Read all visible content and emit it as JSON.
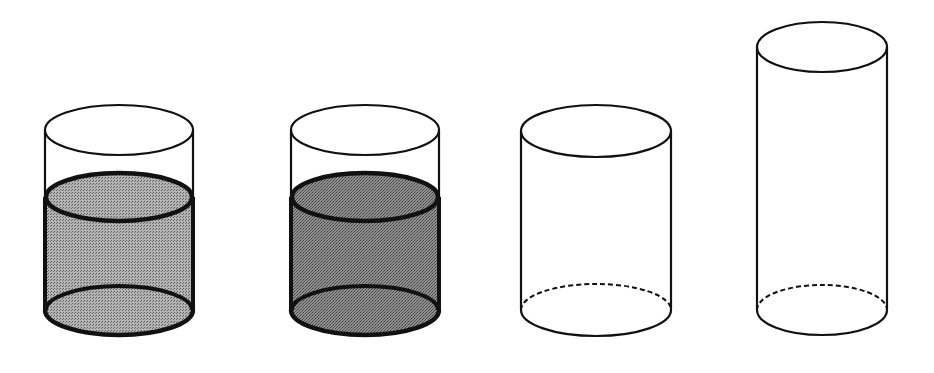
{
  "diagram": {
    "title": "",
    "colors": {
      "background": "#ffffff",
      "outline": "#1a1a1a",
      "liquid_light": "#9a9a9a",
      "liquid_light_surface": "#a8a8a8",
      "liquid_dark": "#7c7c7c",
      "liquid_dark_surface": "#8e8e8e"
    },
    "cylinders": [
      {
        "id": "cylinder-1",
        "filled": true,
        "shade": "light",
        "left": 45,
        "right": 193,
        "top_cy": 130,
        "bottom_cy": 310,
        "ry": 25,
        "liquid_cy": 197
      },
      {
        "id": "cylinder-2",
        "filled": true,
        "shade": "dark",
        "left": 291,
        "right": 439,
        "top_cy": 130,
        "bottom_cy": 310,
        "ry": 25,
        "liquid_cy": 197
      },
      {
        "id": "cylinder-3",
        "filled": false,
        "shade": "none",
        "left": 521,
        "right": 671,
        "top_cy": 131,
        "bottom_cy": 310,
        "ry": 26
      },
      {
        "id": "cylinder-4",
        "filled": false,
        "shade": "none",
        "left": 757,
        "right": 887,
        "top_cy": 47,
        "bottom_cy": 310,
        "ry": 25
      }
    ]
  }
}
